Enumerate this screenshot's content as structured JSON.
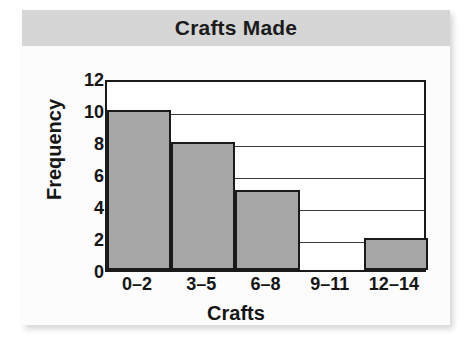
{
  "card": {
    "background_color": "#fbfbfb",
    "header_color": "#d6d6d6"
  },
  "chart_data": {
    "type": "bar",
    "title": "Crafts Made",
    "xlabel": "Crafts",
    "ylabel": "Frequency",
    "categories": [
      "0–2",
      "3–5",
      "6–8",
      "9–11",
      "12–14"
    ],
    "values": [
      10,
      8,
      5,
      0,
      2
    ],
    "ylim": [
      0,
      12
    ],
    "yticks": [
      0,
      2,
      4,
      6,
      8,
      10,
      12
    ],
    "ytick_labels": [
      "0",
      "2",
      "4",
      "6",
      "8",
      "10",
      "12"
    ],
    "grid": true,
    "grid_axis": "y",
    "legend": false,
    "bar_color": "#a6a6a6",
    "bar_edge_color": "#1a1a1a",
    "plot_background": "#ffffff"
  }
}
